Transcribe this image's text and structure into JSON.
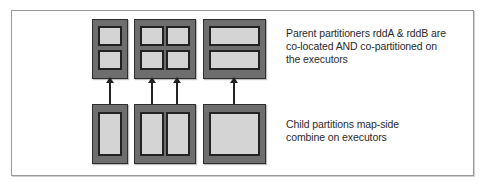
{
  "diagram": {
    "type": "partition-flow",
    "top_row": {
      "label": "Parent partitioners rddA & rddB are\nco-located AND co-partitioned on\nthe executors",
      "blocks": [
        {
          "name": "executor-1",
          "layout": "2 rows x 1 col",
          "partitions": 2
        },
        {
          "name": "executor-2",
          "layout": "2 rows x 2 cols",
          "partitions": 4
        },
        {
          "name": "executor-3",
          "layout": "2 rows x 1 col (wide)",
          "partitions": 2
        }
      ]
    },
    "bottom_row": {
      "label": "Child partitions map-side\ncombine on executors",
      "blocks": [
        {
          "name": "executor-1",
          "layout": "1 partition",
          "partitions": 1
        },
        {
          "name": "executor-2",
          "layout": "1 row x 2 cols",
          "partitions": 2
        },
        {
          "name": "executor-3",
          "layout": "1 partition (wide)",
          "partitions": 1
        }
      ]
    },
    "arrows": [
      {
        "from": "bottom executor-1",
        "to": "top executor-1"
      },
      {
        "from": "bottom executor-2 left",
        "to": "top executor-2 left"
      },
      {
        "from": "bottom executor-2 right",
        "to": "top executor-2 right"
      },
      {
        "from": "bottom executor-3",
        "to": "top executor-3"
      }
    ],
    "colors": {
      "block_fill": "#6e6e6e",
      "cell_fill": "#d4d4d4",
      "border": "#222222",
      "frame": "#9a9a9a"
    }
  }
}
